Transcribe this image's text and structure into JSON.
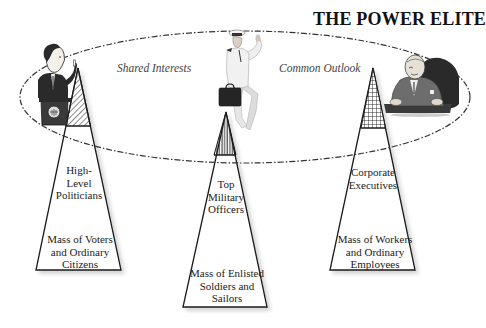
{
  "title": "THE POWER ELITE",
  "ellipse_labels": {
    "left": "Shared Interests",
    "right": "Common Outlook"
  },
  "pyramids": [
    {
      "name": "political",
      "figure": "politician-at-podium",
      "pattern": "diagonal-hatch",
      "top_label": [
        "High-",
        "Level",
        "Politicians"
      ],
      "bottom_label": [
        "Mass of Voters",
        "and Ordinary",
        "Citizens"
      ]
    },
    {
      "name": "military",
      "figure": "naval-officer-with-briefcase",
      "pattern": "vertical-hatch",
      "top_label": [
        "Top",
        "Military",
        "Officers"
      ],
      "bottom_label": [
        "Mass of Enlisted",
        "Soldiers and",
        "Sailors"
      ]
    },
    {
      "name": "corporate",
      "figure": "executive-in-armchair",
      "pattern": "crosshatch-grid",
      "top_label": [
        "Corporate",
        "Executives"
      ],
      "bottom_label": [
        "Mass of Workers",
        "and Ordinary",
        "Employees"
      ]
    }
  ],
  "colors": {
    "line": "#1a1a1a",
    "ellipse_dash": "#333333",
    "figure_dark": "#2a2a2a",
    "figure_mid": "#6a6a6a",
    "figure_light": "#e8e8e8",
    "background": "#ffffff"
  }
}
